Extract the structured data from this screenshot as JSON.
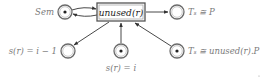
{
  "diagram": {
    "type": "petri-net",
    "transition": {
      "id": "unused",
      "label": "unused(r)"
    },
    "places": [
      {
        "id": "sem",
        "label": "Sem",
        "has_token": true,
        "label_position": "left"
      },
      {
        "id": "ts_p",
        "label": "Tₛ ≅ P",
        "has_token": false,
        "label_position": "right"
      },
      {
        "id": "s_i_minus_1",
        "label": "s(r) = i − 1",
        "has_token": false,
        "label_position": "left"
      },
      {
        "id": "s_i",
        "label": "s(r) = i",
        "has_token": true,
        "label_position": "below"
      },
      {
        "id": "ts_unused_p",
        "label": "Tₛ ≅ unused(r).P",
        "has_token": true,
        "label_position": "right"
      }
    ],
    "arcs": [
      {
        "from": "sem",
        "to": "unused"
      },
      {
        "from": "unused",
        "to": "sem"
      },
      {
        "from": "unused",
        "to": "ts_p"
      },
      {
        "from": "unused",
        "to": "s_i_minus_1"
      },
      {
        "from": "s_i",
        "to": "unused"
      },
      {
        "from": "ts_unused_p",
        "to": "unused"
      }
    ],
    "colors": {
      "label": "#7a7a7a",
      "stroke": "#333333",
      "token": "#222222"
    }
  }
}
